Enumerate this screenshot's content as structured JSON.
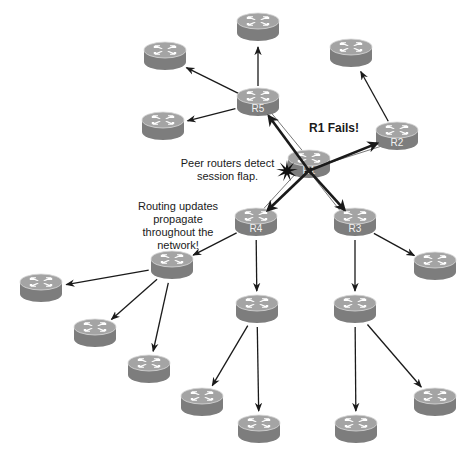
{
  "diagram": {
    "title": "",
    "annotations": {
      "failure": "R1 Fails!",
      "detect_line1": "Peer routers detect",
      "detect_line2": "session flap.",
      "propagate_line1": "Routing updates",
      "propagate_line2": "propagate",
      "propagate_line3": "throughout the",
      "propagate_line4": "network!"
    },
    "colors": {
      "router_top": "#a4a4a4",
      "router_side": "#7d7d7d",
      "router_rim": "#d9d9d9",
      "arrow": "#1a1a1a",
      "background": "#ffffff"
    },
    "routers": [
      {
        "id": "r1",
        "label": "R1",
        "x": 309,
        "y": 165,
        "failed": true
      },
      {
        "id": "r2",
        "label": "R2",
        "x": 397,
        "y": 137
      },
      {
        "id": "r3",
        "label": "R3",
        "x": 355,
        "y": 223
      },
      {
        "id": "r4",
        "label": "R4",
        "x": 256,
        "y": 223
      },
      {
        "id": "r5",
        "label": "R5",
        "x": 258,
        "y": 103
      },
      {
        "id": "n-top",
        "label": "",
        "x": 258,
        "y": 28
      },
      {
        "id": "n-topleft",
        "label": "",
        "x": 165,
        "y": 57
      },
      {
        "id": "n-midleft",
        "label": "",
        "x": 163,
        "y": 127
      },
      {
        "id": "n-topright",
        "label": "",
        "x": 351,
        "y": 54
      },
      {
        "id": "n-hub-left",
        "label": "",
        "x": 172,
        "y": 266
      },
      {
        "id": "n-leftmost",
        "label": "",
        "x": 41,
        "y": 289
      },
      {
        "id": "n-left2",
        "label": "",
        "x": 95,
        "y": 334
      },
      {
        "id": "n-left3",
        "label": "",
        "x": 149,
        "y": 370
      },
      {
        "id": "n-r4-child",
        "label": "",
        "x": 257,
        "y": 310
      },
      {
        "id": "n-r3-child",
        "label": "",
        "x": 355,
        "y": 310
      },
      {
        "id": "n-r3-right",
        "label": "",
        "x": 435,
        "y": 267
      },
      {
        "id": "n-bot1",
        "label": "",
        "x": 202,
        "y": 403
      },
      {
        "id": "n-bot2",
        "label": "",
        "x": 259,
        "y": 430
      },
      {
        "id": "n-bot3",
        "label": "",
        "x": 356,
        "y": 430
      },
      {
        "id": "n-bot4",
        "label": "",
        "x": 435,
        "y": 403
      }
    ],
    "update_arrows": [
      {
        "from": "r5",
        "to": "n-top"
      },
      {
        "from": "r5",
        "to": "n-topleft"
      },
      {
        "from": "r5",
        "to": "n-midleft"
      },
      {
        "from": "r2",
        "to": "n-topright"
      },
      {
        "from": "r4",
        "to": "n-hub-left"
      },
      {
        "from": "r4",
        "to": "n-r4-child"
      },
      {
        "from": "r3",
        "to": "n-r3-child"
      },
      {
        "from": "r3",
        "to": "n-r3-right"
      },
      {
        "from": "n-hub-left",
        "to": "n-leftmost"
      },
      {
        "from": "n-hub-left",
        "to": "n-left2"
      },
      {
        "from": "n-hub-left",
        "to": "n-left3"
      },
      {
        "from": "n-r4-child",
        "to": "n-bot1"
      },
      {
        "from": "n-r4-child",
        "to": "n-bot2"
      },
      {
        "from": "n-r3-child",
        "to": "n-bot3"
      },
      {
        "from": "n-r3-child",
        "to": "n-bot4"
      }
    ],
    "session_links": [
      {
        "from": "r1",
        "to": "r5"
      },
      {
        "from": "r1",
        "to": "r2"
      },
      {
        "from": "r1",
        "to": "r3"
      },
      {
        "from": "r1",
        "to": "r4"
      }
    ],
    "flap_arrows": [
      {
        "from": "r1",
        "to": "r5"
      },
      {
        "from": "r1",
        "to": "r2"
      },
      {
        "from": "r1",
        "to": "r3"
      },
      {
        "from": "r1",
        "to": "r4"
      }
    ]
  }
}
